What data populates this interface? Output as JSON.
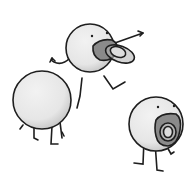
{
  "illustration": {
    "description": "Three round cartoon blob characters with stick limbs; two wear pacifiers",
    "colors": {
      "background": "#ffffff",
      "body_fill": "#ebebeb",
      "body_shade": "#c8c8c8",
      "outline": "#1e1e1e",
      "pacifier_fill": "#8a8a8a",
      "pacifier_light": "#b5b5b5"
    },
    "characters": [
      {
        "name": "jumping-character-with-pacifier",
        "pose": "leaping, pointing right"
      },
      {
        "name": "back-facing-character",
        "pose": "standing, seen from behind"
      },
      {
        "name": "standing-character-with-pacifier",
        "pose": "standing, facing viewer"
      }
    ]
  }
}
